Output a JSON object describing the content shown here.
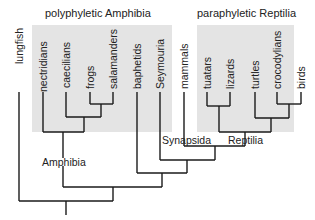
{
  "groups": {
    "amphibia": {
      "title": "polyphyletic Amphibia"
    },
    "reptilia": {
      "title": "paraphyletic Reptilia"
    }
  },
  "taxa": [
    {
      "name": "lungfish",
      "x": 19,
      "tip": 64
    },
    {
      "name": "nectridians",
      "x": 43,
      "tip": 92
    },
    {
      "name": "caecilians",
      "x": 66,
      "tip": 88
    },
    {
      "name": "frogs",
      "x": 90,
      "tip": 58
    },
    {
      "name": "salamanders",
      "x": 113,
      "tip": 88
    },
    {
      "name": "baphetids",
      "x": 137,
      "tip": 85
    },
    {
      "name": "Seymouria",
      "x": 160,
      "tip": 88
    },
    {
      "name": "mammals",
      "x": 184,
      "tip": 75
    },
    {
      "name": "tuatars",
      "x": 207,
      "tip": 78
    },
    {
      "name": "lizards",
      "x": 230,
      "tip": 65
    },
    {
      "name": "turtles",
      "x": 255,
      "tip": 63
    },
    {
      "name": "crocodylians",
      "x": 277,
      "tip": 95
    },
    {
      "name": "birds",
      "x": 301,
      "tip": 55
    }
  ],
  "clade_labels": {
    "amphibia": "Amphibia",
    "synapsida": "Synapsida",
    "reptilia": "Reptilia"
  },
  "colors": {
    "box": "#e4e4e4",
    "line": "#1a1a1a"
  }
}
